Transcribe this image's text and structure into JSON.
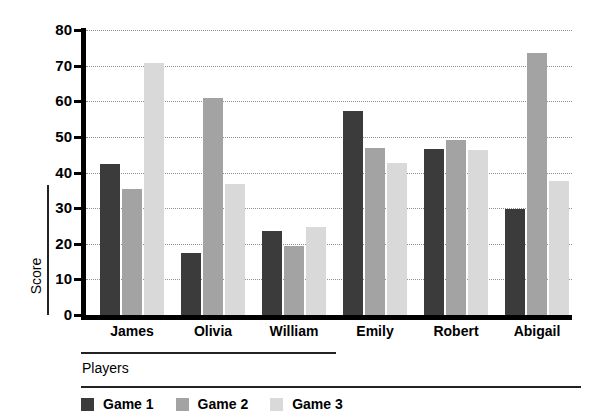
{
  "chart_data": {
    "type": "bar",
    "title": "",
    "xlabel": "Players",
    "ylabel": "Score",
    "categories": [
      "James",
      "Olivia",
      "William",
      "Emily",
      "Robert",
      "Abigail"
    ],
    "series": [
      {
        "name": "Game 1",
        "color": "#3b3b3b",
        "values": [
          42.4,
          17.5,
          23.5,
          57.2,
          46.5,
          29.8
        ]
      },
      {
        "name": "Game 2",
        "color": "#a3a3a3",
        "values": [
          35.5,
          61.0,
          19.3,
          46.8,
          49.0,
          73.5
        ]
      },
      {
        "name": "Game 3",
        "color": "#d9d9d9",
        "values": [
          70.8,
          36.8,
          24.6,
          42.8,
          46.2,
          37.5
        ]
      }
    ],
    "ylim": [
      0,
      80
    ],
    "yticks": [
      0,
      10,
      20,
      30,
      40,
      50,
      60,
      70,
      80
    ],
    "ytick_labels": [
      "0",
      "10",
      "20",
      "30",
      "40",
      "50",
      "60",
      "70",
      "80"
    ],
    "grid": true,
    "grid_style": "dotted",
    "legend_position": "bottom-left",
    "bar_width_px": 20,
    "axis_color": "#000000",
    "grid_color": "#909090",
    "background": "#ffffff"
  }
}
